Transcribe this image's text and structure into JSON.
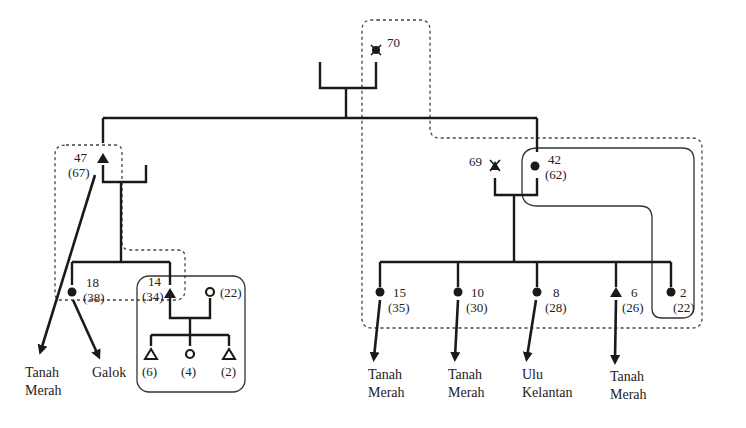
{
  "diagram": {
    "type": "kinship-migration-chart",
    "symbols": {
      "male": "filled-triangle",
      "female": "filled-circle",
      "male_child": "open-triangle",
      "female_child": "open-circle",
      "deceased": "x-marked"
    },
    "people": {
      "p70": {
        "id": "70",
        "sex": "female",
        "deceased": true,
        "label": "70"
      },
      "p47": {
        "id": "47",
        "age": "(67)",
        "sex": "male",
        "label": "47",
        "age_label": "(67)"
      },
      "p69": {
        "id": "69",
        "sex": "male",
        "deceased": true,
        "label": "69"
      },
      "p42": {
        "id": "42",
        "age": "(62)",
        "sex": "female",
        "label": "42",
        "age_label": "(62)"
      },
      "p18": {
        "id": "18",
        "age": "(38)",
        "sex": "female",
        "label": "18",
        "age_label": "(38)"
      },
      "p14": {
        "id": "14",
        "age": "(34)",
        "sex": "male",
        "label": "14",
        "age_label": "(34)"
      },
      "p14_spouse": {
        "age": "(22)",
        "sex": "female",
        "age_label": "(22)"
      },
      "c6": {
        "age": "(6)",
        "sex": "male",
        "age_label": "(6)"
      },
      "c4": {
        "age": "(4)",
        "sex": "female",
        "age_label": "(4)"
      },
      "c2": {
        "age": "(2)",
        "sex": "male",
        "age_label": "(2)"
      },
      "p15": {
        "id": "15",
        "age": "(35)",
        "sex": "female",
        "label": "15",
        "age_label": "(35)"
      },
      "p10": {
        "id": "10",
        "age": "(30)",
        "sex": "female",
        "label": "10",
        "age_label": "(30)"
      },
      "p8": {
        "id": "8",
        "age": "(28)",
        "sex": "female",
        "label": "8",
        "age_label": "(28)"
      },
      "p6": {
        "id": "6",
        "age": "(26)",
        "sex": "male",
        "label": "6",
        "age_label": "(26)"
      },
      "p2": {
        "id": "2",
        "age": "(22)",
        "sex": "female",
        "label": "2",
        "age_label": "(22)"
      }
    },
    "destinations": {
      "d47": {
        "line1": "Tanah",
        "line2": "Merah"
      },
      "d18": {
        "line1": "Galok",
        "line2": ""
      },
      "d15": {
        "line1": "Tanah",
        "line2": "Merah"
      },
      "d10": {
        "line1": "Tanah",
        "line2": "Merah"
      },
      "d8": {
        "line1": "Ulu",
        "line2": "Kelantan"
      },
      "d6": {
        "line1": "Tanah",
        "line2": "Merah"
      }
    },
    "groupings": [
      {
        "style": "dotted",
        "members": [
          "70",
          "42",
          "15",
          "10",
          "8",
          "6",
          "2"
        ]
      },
      {
        "style": "dotted",
        "members": [
          "47",
          "14"
        ]
      },
      {
        "style": "solid",
        "members": [
          "14",
          "(22)",
          "(6)",
          "(4)",
          "(2)"
        ]
      },
      {
        "style": "solid",
        "members": [
          "42",
          "2"
        ]
      }
    ]
  }
}
